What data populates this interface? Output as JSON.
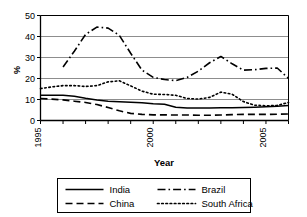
{
  "chart_data": {
    "type": "line",
    "title": "",
    "xlabel": "Year",
    "ylabel": "%",
    "xlim": [
      1995,
      2006
    ],
    "ylim": [
      0,
      50
    ],
    "yticks": [
      0,
      10,
      20,
      30,
      40,
      50
    ],
    "ytick_labels": [
      "0",
      "10",
      "20",
      "30",
      "40",
      "50"
    ],
    "xticks": [
      1995,
      1996,
      1997,
      1998,
      1999,
      2000,
      2001,
      2002,
      2003,
      2004,
      2005,
      2006
    ],
    "xtick_labels": [
      "1995",
      "",
      "",
      "",
      "",
      "2000",
      "",
      "",
      "",
      "",
      "2005",
      ""
    ],
    "grid": "horizontal",
    "legend_position": "below",
    "x": [
      1995,
      1995.5,
      1996,
      1996.5,
      1997,
      1997.5,
      1998,
      1998.5,
      1999,
      1999.5,
      2000,
      2000.5,
      2001,
      2001.5,
      2002,
      2002.5,
      2003,
      2003.5,
      2004,
      2004.5,
      2005,
      2005.5,
      2006
    ],
    "series": [
      {
        "name": "India",
        "style": "solid",
        "values": [
          12.0,
          12.0,
          12.0,
          11.6,
          10.6,
          9.8,
          9.2,
          8.9,
          8.7,
          8.5,
          8.0,
          7.7,
          6.3,
          6.0,
          6.0,
          6.0,
          6.1,
          6.1,
          6.2,
          6.3,
          6.5,
          6.8,
          7.2
        ]
      },
      {
        "name": "China",
        "style": "dashed",
        "values": [
          10.5,
          10.2,
          9.8,
          9.2,
          8.6,
          7.6,
          6.2,
          4.6,
          3.4,
          2.9,
          2.7,
          2.7,
          2.6,
          2.6,
          2.5,
          2.5,
          2.6,
          2.8,
          2.9,
          2.9,
          2.9,
          3.0,
          3.1
        ]
      },
      {
        "name": "Brazil",
        "style": "dashdot",
        "values": [
          null,
          null,
          25.5,
          33.0,
          41.0,
          44.5,
          44.0,
          40.5,
          32.0,
          24.0,
          20.5,
          19.5,
          19.0,
          20.5,
          23.5,
          27.5,
          30.5,
          27.0,
          24.0,
          24.2,
          24.8,
          25.0,
          20.0
        ]
      },
      {
        "name": "South Africa",
        "style": "dotted",
        "values": [
          15.2,
          16.0,
          16.6,
          16.6,
          16.2,
          16.6,
          18.4,
          18.9,
          16.5,
          14.0,
          12.5,
          12.4,
          12.0,
          10.5,
          10.2,
          11.0,
          13.5,
          12.5,
          9.0,
          7.3,
          7.0,
          7.2,
          8.6
        ]
      }
    ]
  },
  "legend": {
    "items": [
      {
        "label": "India",
        "style": "solid"
      },
      {
        "label": "Brazil",
        "style": "dashdot"
      },
      {
        "label": "China",
        "style": "dashed"
      },
      {
        "label": "South Africa",
        "style": "dotted"
      }
    ]
  },
  "colors": {
    "line": "#000000",
    "grid": "#808080",
    "axis": "#000000",
    "background": "#ffffff"
  }
}
